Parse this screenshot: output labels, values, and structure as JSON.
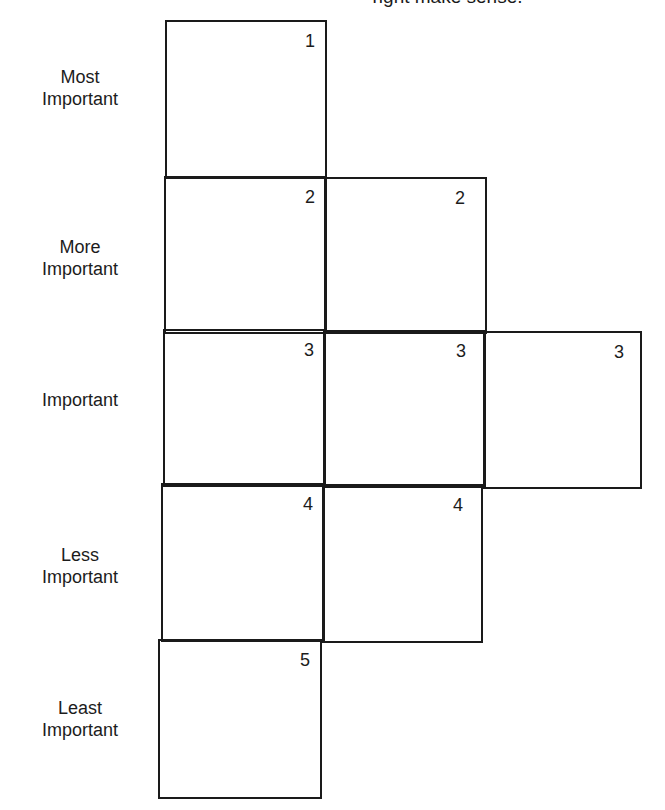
{
  "caption": {
    "text": "right make sense."
  },
  "rows": [
    {
      "label_line1": "Most",
      "label_line2": "Important",
      "rank": "1",
      "cells": [
        "1"
      ]
    },
    {
      "label_line1": "More",
      "label_line2": "Important",
      "rank": "2",
      "cells": [
        "2",
        "2"
      ]
    },
    {
      "label_line1": "",
      "label_line2": "Important",
      "rank": "3",
      "cells": [
        "3",
        "3",
        "3"
      ]
    },
    {
      "label_line1": "Less",
      "label_line2": "Important",
      "rank": "4",
      "cells": [
        "4",
        "4"
      ]
    },
    {
      "label_line1": "Least",
      "label_line2": "Important",
      "rank": "5",
      "cells": [
        "5"
      ]
    }
  ],
  "colors": {
    "line": "#1a1a1a",
    "text": "#1c1c1c",
    "background": "#ffffff"
  }
}
